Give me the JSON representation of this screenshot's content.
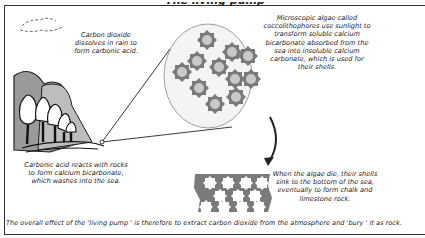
{
  "diagram": {
    "type": "process-illustration",
    "title_partial": "The living pump",
    "captions": {
      "rain": "Carbon dioxide dissolves in rain to form carbonic acid.",
      "algae": "Microscopic algae called coccolithophores use sunlight to transform soluble calcium bicarbonate absorbed from the sea into insoluble calcium carbonate, which is used for their shells.",
      "rocks": "Carbonic acid reacts with rocks to form calcium bicarbonate, which washes into the sea.",
      "sediment": "When the algae die, their shells sink to the bottom of the sea, eventually to form chalk and limestone rock."
    },
    "caption_lines": {
      "rain": [
        "Carbon dioxide",
        "dissolves in rain to",
        "form carbonic acid."
      ],
      "algae": [
        "Microscopic algae called",
        "coccolithophores use sunlight to",
        "transform soluble calcium",
        "bicarbonate absorbed from the",
        "sea into insoluble calcium",
        "carbonate, which is used for",
        "their shells."
      ],
      "rocks": [
        "Carbonic acid reacts with rocks",
        "to form calcium bicarbonate,",
        "which washes into the sea."
      ],
      "sediment": [
        "When the algae die, their shells",
        "sink to the bottom of the sea,",
        "eventually to form chalk and",
        "limestone rock."
      ]
    },
    "conclusion": "The overall effect of the  'living pump ' is therefore to extract carbon dioxide from the atmosphere and  'bury ' it as rock.",
    "elements": {
      "cloud": "cloud-icon",
      "landscape": "hills-and-trees",
      "magnifier": "magnified-circle-of-coccolithophores",
      "arrow": "curved-arrow-down",
      "sediment": "chalk-layer-of-shells"
    },
    "colors": {
      "outline": "#333333",
      "shell_dark": "#7a7a7a",
      "shell_light": "#c8c8c8",
      "hill": "#9a9a9a",
      "circle_fill": "#f4f4f4"
    }
  }
}
